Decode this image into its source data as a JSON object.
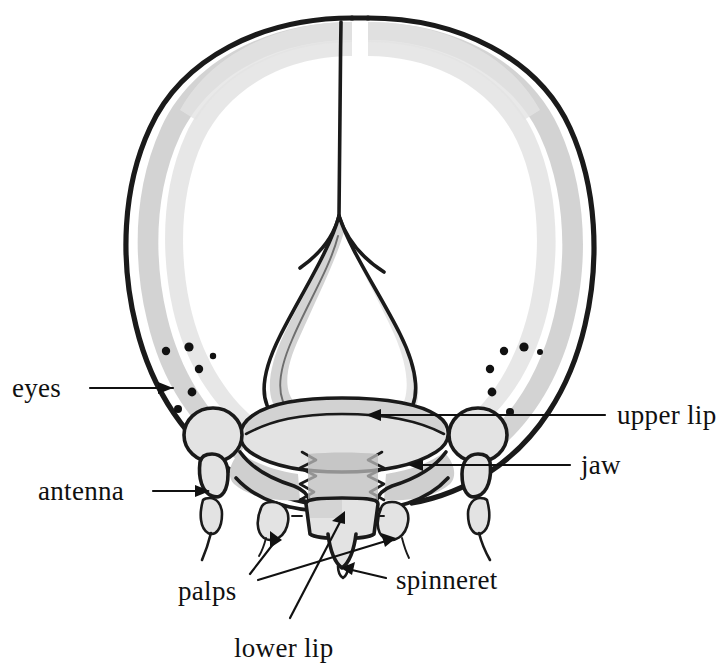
{
  "figure": {
    "title": "Caterpillar head, front view (anatomical diagram)",
    "style": "pen and ink line drawing with grey wash shading",
    "background_color": "#ffffff",
    "ink_color": "#1a1a1a",
    "shade_light": "#e3e3e3",
    "shade_mid": "#cfcfcf",
    "shade_dark": "#bcbcbc"
  },
  "labels": {
    "eyes": "eyes",
    "antenna": "antenna",
    "upper_lip": "upper lip",
    "jaw": "jaw",
    "palps": "palps",
    "spinneret": "spinneret",
    "lower_lip": "lower lip"
  },
  "parts": {
    "head_capsule": "head capsule",
    "epicranial_suture": "epicranial suture",
    "frons": "frons",
    "labrum": "upper lip",
    "mandible_left": "left jaw",
    "mandible_right": "right jaw",
    "antenna_left": "left antenna",
    "antenna_right": "right antenna",
    "eye_cluster_left": "left eye cluster",
    "eye_cluster_right": "right eye cluster",
    "palp_outer_left": "outer left palp",
    "palp_inner_left": "inner left palp",
    "palp_inner_right": "inner right palp",
    "palp_outer_right": "outer right palp",
    "labium": "lower lip",
    "spinneret": "spinneret"
  },
  "eye_counts": {
    "left": 6,
    "right": 6
  }
}
